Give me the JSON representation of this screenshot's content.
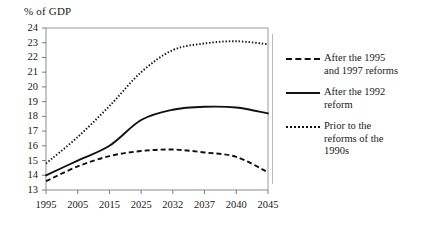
{
  "chart_data": {
    "type": "line",
    "title": "% of GDP",
    "xlabel": "",
    "ylabel": "% of GDP",
    "x": [
      "1995",
      "2005",
      "2015",
      "2025",
      "2032",
      "2037",
      "2040",
      "2045"
    ],
    "categories": [
      "1995",
      "2005",
      "2015",
      "2025",
      "2032",
      "2037",
      "2040",
      "2045"
    ],
    "ylim": [
      13,
      24
    ],
    "yticks": [
      "13",
      "14",
      "15",
      "16",
      "17",
      "18",
      "19",
      "20",
      "21",
      "22",
      "23",
      "24"
    ],
    "grid": false,
    "legend_position": "right",
    "series": [
      {
        "name": "After the 1995 and 1997 reforms",
        "style": "dashed",
        "color": "#111111",
        "values": [
          13.6,
          14.6,
          15.3,
          15.65,
          15.75,
          15.55,
          15.25,
          14.2
        ]
      },
      {
        "name": "After the 1992 reform",
        "style": "solid",
        "color": "#111111",
        "values": [
          14.0,
          15.0,
          16.0,
          17.75,
          18.45,
          18.65,
          18.6,
          18.2
        ]
      },
      {
        "name": "Prior to the reforms of the 1990s",
        "style": "dotted",
        "color": "#111111",
        "values": [
          14.8,
          16.6,
          18.7,
          21.0,
          22.5,
          22.95,
          23.1,
          22.9
        ]
      }
    ]
  },
  "legend": {
    "entries": [
      {
        "label_line1": "After the 1995",
        "label_line2": "and 1997 reforms",
        "style": "dashed"
      },
      {
        "label_line1": "After the 1992",
        "label_line2": "reform",
        "style": "solid"
      },
      {
        "label_line1": "Prior to the",
        "label_line2": "reforms of the",
        "label_line3": "1990s",
        "style": "dotted"
      }
    ]
  },
  "colors": {
    "line": "#111111",
    "axis": "#7a7a7a",
    "divider": "#b9b9b9",
    "background": "#ffffff"
  }
}
